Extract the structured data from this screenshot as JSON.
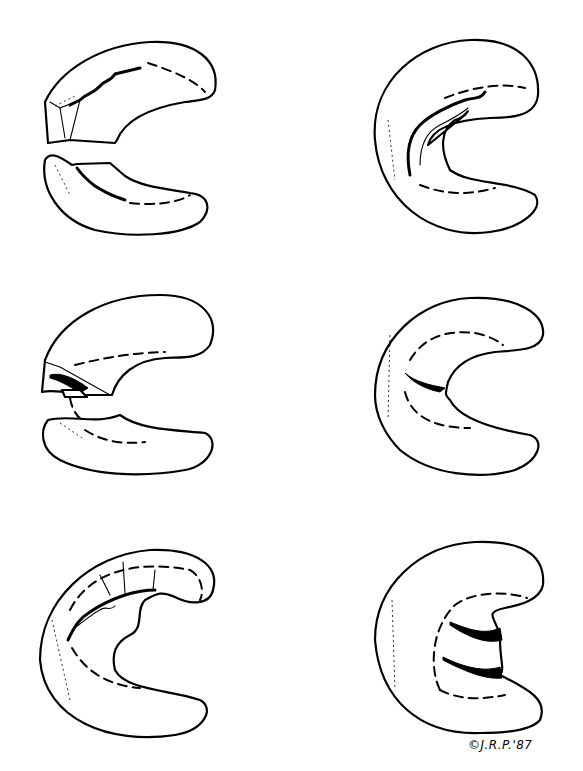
{
  "figure": {
    "background": "#ffffff",
    "ink": "#000000",
    "signature": "©J.R.P.'87",
    "panels": [
      {
        "id": "top-left",
        "row": 1,
        "col": 1,
        "depiction": "meniscus split into two fragments (upper and lower) with jagged tear edges"
      },
      {
        "id": "top-right",
        "row": 1,
        "col": 2,
        "depiction": "intact C-shape with longitudinal jagged tear along inner rim"
      },
      {
        "id": "middle-left",
        "row": 2,
        "col": 1,
        "depiction": "two fragments with flap/dislocated piece at the left"
      },
      {
        "id": "middle-right",
        "row": 2,
        "col": 2,
        "depiction": "C-shape with small horizontal radial tear at mid inner rim"
      },
      {
        "id": "bottom-left",
        "row": 3,
        "col": 1,
        "depiction": "C-shape with complex degenerative tear with radial cracks"
      },
      {
        "id": "bottom-right",
        "row": 3,
        "col": 2,
        "depiction": "C-shape with double horizontal tears forming a displaced segment"
      }
    ]
  }
}
